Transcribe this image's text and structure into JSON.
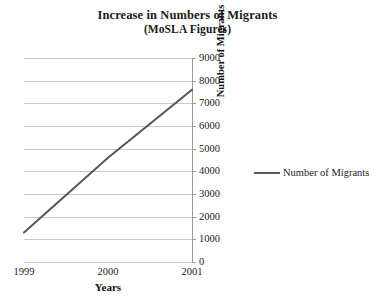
{
  "chart_data": {
    "type": "line",
    "title": "Increase in Numbers of Migrants",
    "subtitle": "(MoSLA Figures)",
    "xlabel": "Years",
    "ylabel": "Number of Migrants",
    "categories": [
      "1999",
      "2000",
      "2001"
    ],
    "x": [
      1999,
      2000,
      2001
    ],
    "series": [
      {
        "name": "Number of Migrants",
        "values": [
          1300,
          4600,
          7600
        ],
        "color": "#595959"
      }
    ],
    "ylim": [
      0,
      9000
    ],
    "ytick_step": 1000,
    "yticks": [
      9000,
      8000,
      7000,
      6000,
      5000,
      4000,
      3000,
      2000,
      1000,
      0
    ],
    "ytick_labels": [
      "9000",
      "8000",
      "7000",
      "6000",
      "5000",
      "4000",
      "3000",
      "2000",
      "1000",
      "0"
    ],
    "xtick_labels": [
      "1999",
      "2000",
      "2001"
    ],
    "grid": "horizontal",
    "y_axis_position": "right",
    "legend_position": "right",
    "legend_entries": [
      "Number of Migrants"
    ],
    "background_color": "#ffffff",
    "gridline_color": "#c9c9c9"
  }
}
